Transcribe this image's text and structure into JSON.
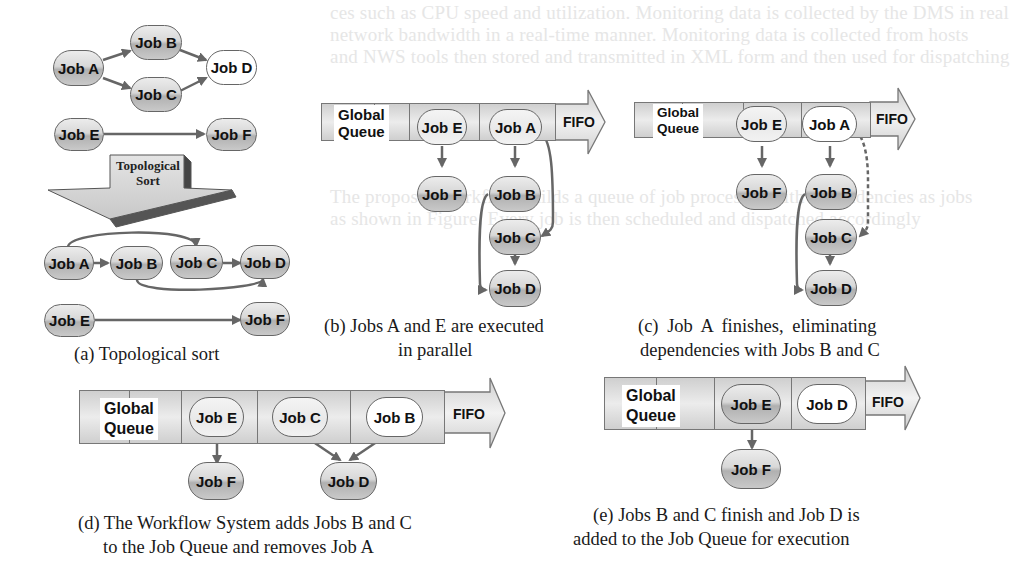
{
  "background_text": {
    "line1": "ces such as CPU speed and utilization. Monitoring data is collected by the DMS in real",
    "line2": "network bandwidth in a real-time manner. Monitoring data is collected from hosts",
    "line3": "and NWS tools then stored and transmitted in XML form and then used for dispatching",
    "line4": "The proposed workflow builds a queue of job processes with dependencies as jobs",
    "line5": "as shown in Figure. Every job is then scheduled and dispatched accordingly"
  },
  "panel_a": {
    "caption": "(a) Topological sort",
    "sort_label_line1": "Topological",
    "sort_label_line2": "Sort",
    "graph_top": {
      "nodes": [
        "Job A",
        "Job B",
        "Job C",
        "Job D",
        "Job E",
        "Job F"
      ],
      "edges": [
        [
          "Job A",
          "Job B"
        ],
        [
          "Job A",
          "Job C"
        ],
        [
          "Job B",
          "Job D"
        ],
        [
          "Job C",
          "Job D"
        ],
        [
          "Job E",
          "Job F"
        ]
      ]
    },
    "graph_sorted": {
      "order": [
        "Job A",
        "Job B",
        "Job C",
        "Job D"
      ],
      "second_row": [
        "Job E",
        "Job F"
      ],
      "edges": [
        [
          "Job A",
          "Job B"
        ],
        [
          "Job A",
          "Job C"
        ],
        [
          "Job C",
          "Job D"
        ],
        [
          "Job B",
          "Job D"
        ],
        [
          "Job E",
          "Job F"
        ]
      ]
    }
  },
  "panel_b": {
    "caption_line1": "(b) Jobs A and E are executed",
    "caption_line2": "in parallel",
    "queue_label_line1": "Global",
    "queue_label_line2": "Queue",
    "fifo": "FIFO",
    "queue_jobs": [
      "Job E",
      "Job A"
    ],
    "children": [
      "Job F",
      "Job B",
      "Job C",
      "Job D"
    ]
  },
  "panel_c": {
    "caption_line1": "(c)  Job  A  finishes,  eliminating",
    "caption_line2": "dependencies with Jobs B and C",
    "queue_label_line1": "Global",
    "queue_label_line2": "Queue",
    "fifo": "FIFO",
    "queue_jobs": [
      "Job E",
      "Job A"
    ],
    "children": [
      "Job F",
      "Job B",
      "Job C",
      "Job D"
    ]
  },
  "panel_d": {
    "caption_line1": "(d) The Workflow System adds Jobs B and C",
    "caption_line2": "to the Job Queue and removes Job A",
    "queue_label_line1": "Global",
    "queue_label_line2": "Queue",
    "fifo": "FIFO",
    "queue_jobs": [
      "Job E",
      "Job C",
      "Job B"
    ],
    "children": [
      "Job F",
      "Job D"
    ]
  },
  "panel_e": {
    "caption_line1": "(e) Jobs B and C finish and Job D is",
    "caption_line2": "added to the Job Queue for execution",
    "queue_label_line1": "Global",
    "queue_label_line2": "Queue",
    "fifo": "FIFO",
    "queue_jobs": [
      "Job E",
      "Job D"
    ],
    "children": [
      "Job F"
    ]
  },
  "colors": {
    "node_fill": "#c8c8c8",
    "node_border": "#666666",
    "arrow": "#666666",
    "queue_fill": "#e0e0e0",
    "text": "#111111"
  }
}
